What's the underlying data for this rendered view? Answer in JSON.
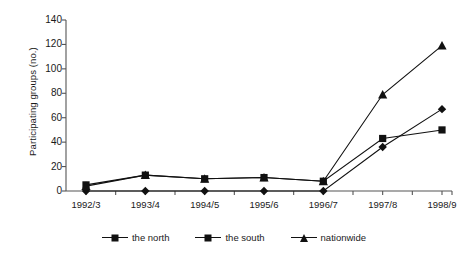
{
  "chart_data": {
    "type": "line",
    "title": "",
    "xlabel": "",
    "ylabel": "Participating groups (no.)",
    "categories": [
      "1992/3",
      "1993/4",
      "1994/5",
      "1995/6",
      "1996/7",
      "1997/8",
      "1998/9"
    ],
    "ylim": [
      0,
      140
    ],
    "ytick_labels": [
      "0",
      "20",
      "40",
      "60",
      "80",
      "100",
      "120",
      "140"
    ],
    "ytick_values": [
      0,
      20,
      40,
      60,
      80,
      100,
      120,
      140
    ],
    "grid": false,
    "legend_position": "bottom",
    "series": [
      {
        "name": "the north",
        "marker": "diamond",
        "color": "#111111",
        "values": [
          0,
          0,
          0,
          0,
          0,
          36,
          67
        ]
      },
      {
        "name": "the south",
        "marker": "square",
        "color": "#111111",
        "values": [
          5,
          13,
          10,
          11,
          8,
          43,
          50
        ]
      },
      {
        "name": "nationwide",
        "marker": "triangle",
        "color": "#111111",
        "values": [
          4,
          13,
          10,
          11,
          8,
          79,
          119
        ]
      }
    ]
  },
  "axis": {
    "line_color": "#555555"
  }
}
